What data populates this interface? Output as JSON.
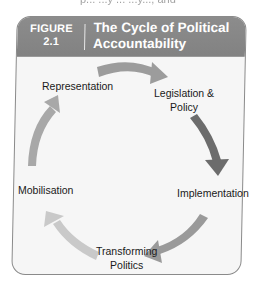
{
  "page_cutoff_text": "p... ...y ... ...y..., and",
  "figure": {
    "label_line1": "FIGURE",
    "label_line2": "2.1",
    "title_line1": "The Cycle of Political",
    "title_line2": "Accountability"
  },
  "cycle": {
    "nodes": [
      {
        "id": "representation",
        "lines": [
          "Representation"
        ]
      },
      {
        "id": "legislation-policy",
        "lines": [
          "Legislation &",
          "Policy"
        ]
      },
      {
        "id": "implementation",
        "lines": [
          "Implementation"
        ]
      },
      {
        "id": "transforming-politics",
        "lines": [
          "Transforming",
          "Politics"
        ]
      },
      {
        "id": "mobilisation",
        "lines": [
          "Mobilisation"
        ]
      }
    ],
    "arrows": [
      {
        "from": "representation",
        "to": "legislation-policy",
        "color": "#9c9c9c"
      },
      {
        "from": "legislation-policy",
        "to": "implementation",
        "color": "#6c6c6c"
      },
      {
        "from": "implementation",
        "to": "transforming-politics",
        "color": "#9a9a9a"
      },
      {
        "from": "transforming-politics",
        "to": "mobilisation",
        "color": "#c9c9c9"
      },
      {
        "from": "mobilisation",
        "to": "representation",
        "color": "#a8a8a8"
      }
    ]
  },
  "colors": {
    "header_bg": "#888888",
    "header_text": "#ffffff",
    "box_bg": "#f6f6f6",
    "box_border": "#8a8a8a"
  }
}
